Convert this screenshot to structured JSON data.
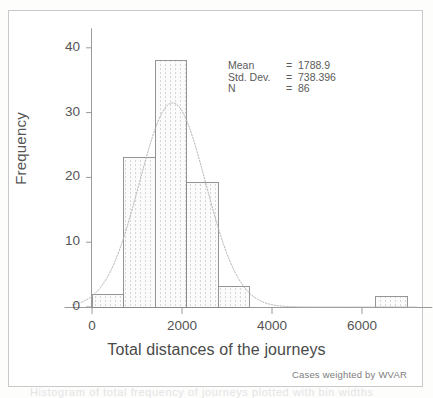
{
  "figure": {
    "ghost_text": "Histogram of total frequency of journeys plotted with bin widths",
    "footnote": "Cases weighted by WVAR"
  },
  "stats": {
    "rows": [
      {
        "label": "Mean",
        "eq": "=",
        "value": "1788.9"
      },
      {
        "label": "Std. Dev.",
        "eq": "=",
        "value": "738.396"
      },
      {
        "label": "N",
        "eq": "=",
        "value": "86"
      }
    ]
  },
  "chart_data": {
    "type": "bar",
    "title": "",
    "xlabel": "Total distances of the journeys",
    "ylabel": "Frequency",
    "xlim": [
      -300,
      7250
    ],
    "ylim": [
      0,
      43
    ],
    "xticks": [
      0,
      2000,
      4000,
      6000
    ],
    "xticklabels": [
      "0",
      "2000",
      "4000",
      "6000"
    ],
    "yticks": [
      0,
      10,
      20,
      30,
      40
    ],
    "yticklabels": [
      "0",
      "10",
      "20",
      "30",
      "40"
    ],
    "grid": false,
    "legend": false,
    "bin_width": 700,
    "bars": [
      {
        "x0": 0,
        "x1": 700,
        "height": 2
      },
      {
        "x0": 700,
        "x1": 1400,
        "height": 23
      },
      {
        "x0": 1400,
        "x1": 2100,
        "height": 38
      },
      {
        "x0": 2100,
        "x1": 2800,
        "height": 19.2
      },
      {
        "x0": 2800,
        "x1": 3500,
        "height": 3.2
      },
      {
        "x0": 6300,
        "x1": 7000,
        "height": 1.6
      }
    ],
    "normal_curve": {
      "mean": 1788.9,
      "std_dev": 738.396,
      "n": 86,
      "peak_frequency": 31.5,
      "style": "dotted"
    },
    "bar_style": {
      "fill": "#f3f3f3",
      "edge": "#8a8a8a",
      "hatch": "vertical-dotted"
    }
  }
}
